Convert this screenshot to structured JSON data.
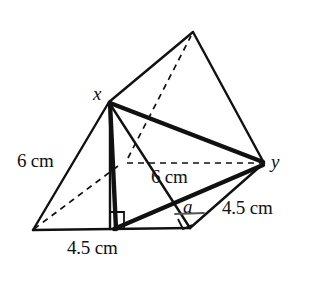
{
  "figure": {
    "kind": "triangular-prism-geometry-diagram",
    "stroke_color": "#111111",
    "background_color": "#ffffff",
    "solid_line_width": 2,
    "bold_line_width": 4,
    "dashed_line_width": 1.6,
    "dash_pattern": "6 5"
  },
  "vertices": {
    "apex": {
      "name": "apex",
      "x": 193,
      "y": 32
    },
    "x": {
      "name": "x",
      "x": 109,
      "y": 102
    },
    "y": {
      "name": "y",
      "x": 264,
      "y": 163
    },
    "bottom_left": {
      "name": "bottom-left",
      "x": 33,
      "y": 230
    },
    "bottom_right": {
      "name": "bottom-right",
      "x": 190,
      "y": 228
    },
    "hidden_back": {
      "name": "hidden-back",
      "x": 124,
      "y": 162
    },
    "altitude_foot": {
      "name": "altitude-foot",
      "x": 110,
      "y": 228
    }
  },
  "labels": {
    "vertex_x": "x",
    "vertex_y": "y",
    "angle_a": "a",
    "edge_left": "6 cm",
    "edge_middle": "6 cm",
    "edge_bottom": "4.5 cm",
    "edge_right": "4.5 cm"
  },
  "label_positions": {
    "vertex_x": {
      "left": 93,
      "top": 84
    },
    "vertex_y": {
      "left": 271,
      "top": 152
    },
    "angle_a": {
      "left": 183,
      "top": 197
    },
    "edge_left": {
      "left": 17,
      "top": 151
    },
    "edge_middle": {
      "left": 151,
      "top": 167
    },
    "edge_bottom": {
      "left": 67,
      "top": 238
    },
    "edge_right": {
      "left": 222,
      "top": 198
    }
  },
  "markers": {
    "right_angle_altitude": {
      "name": "right-angle-mark-altitude",
      "size": 14
    },
    "right_angle_base": {
      "name": "right-angle-mark-base",
      "size": 11
    },
    "angle_a_arm": {
      "name": "angle-a-reference-line"
    }
  }
}
